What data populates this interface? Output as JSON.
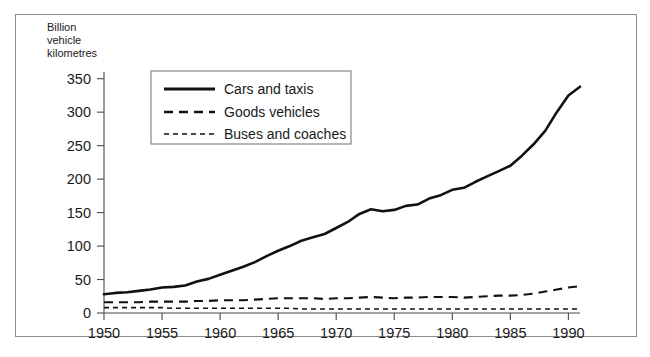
{
  "figure": {
    "background_color": "#ffffff",
    "border_color": "#8c8c8c",
    "ink_color": "#111111"
  },
  "axis_title_lines": {
    "line1": "Billion",
    "line2": "vehicle",
    "line3": "kilometres"
  },
  "legend": {
    "items": [
      {
        "label": "Cars and taxis",
        "style": "solid"
      },
      {
        "label": "Goods vehicles",
        "style": "dashed"
      },
      {
        "label": "Buses and coaches",
        "style": "dotted"
      }
    ]
  },
  "y_ticks": [
    "0",
    "50",
    "100",
    "150",
    "200",
    "250",
    "300",
    "350"
  ],
  "x_ticks": [
    "1950",
    "1955",
    "1960",
    "1965",
    "1970",
    "1975",
    "1980",
    "1985",
    "1990"
  ],
  "chart_data": {
    "type": "line",
    "title": "",
    "subtitle": "",
    "xlabel": "",
    "ylabel": "Billion vehicle kilometres",
    "xlim": [
      1950,
      1991
    ],
    "ylim": [
      0,
      360
    ],
    "grid": false,
    "legend_position": "upper-left-inside",
    "x": [
      1950,
      1951,
      1952,
      1953,
      1954,
      1955,
      1956,
      1957,
      1958,
      1959,
      1960,
      1961,
      1962,
      1963,
      1964,
      1965,
      1966,
      1967,
      1968,
      1969,
      1970,
      1971,
      1972,
      1973,
      1974,
      1975,
      1976,
      1977,
      1978,
      1979,
      1980,
      1981,
      1982,
      1983,
      1984,
      1985,
      1986,
      1987,
      1988,
      1989,
      1990,
      1991
    ],
    "series": [
      {
        "name": "Cars and taxis",
        "style": "solid",
        "values": [
          28,
          30,
          31,
          33,
          35,
          38,
          39,
          41,
          47,
          51,
          57,
          63,
          69,
          76,
          85,
          93,
          100,
          108,
          113,
          118,
          127,
          136,
          148,
          155,
          152,
          154,
          160,
          162,
          171,
          176,
          184,
          187,
          196,
          204,
          212,
          220,
          235,
          252,
          272,
          300,
          325,
          338
        ]
      },
      {
        "name": "Goods vehicles",
        "style": "dashed",
        "values": [
          16,
          16,
          16,
          16,
          17,
          17,
          17,
          17,
          18,
          18,
          19,
          19,
          19,
          20,
          21,
          22,
          22,
          22,
          22,
          21,
          22,
          22,
          23,
          24,
          23,
          22,
          23,
          23,
          24,
          24,
          24,
          23,
          24,
          25,
          26,
          26,
          27,
          29,
          32,
          35,
          38,
          40
        ]
      },
      {
        "name": "Buses and coaches",
        "style": "dotted",
        "values": [
          8,
          8,
          8,
          8,
          8,
          8,
          7,
          7,
          7,
          7,
          7,
          7,
          7,
          7,
          7,
          7,
          7,
          6,
          6,
          6,
          6,
          6,
          6,
          6,
          6,
          6,
          6,
          6,
          6,
          6,
          6,
          6,
          6,
          6,
          6,
          6,
          6,
          6,
          6,
          6,
          6,
          6
        ]
      }
    ]
  }
}
